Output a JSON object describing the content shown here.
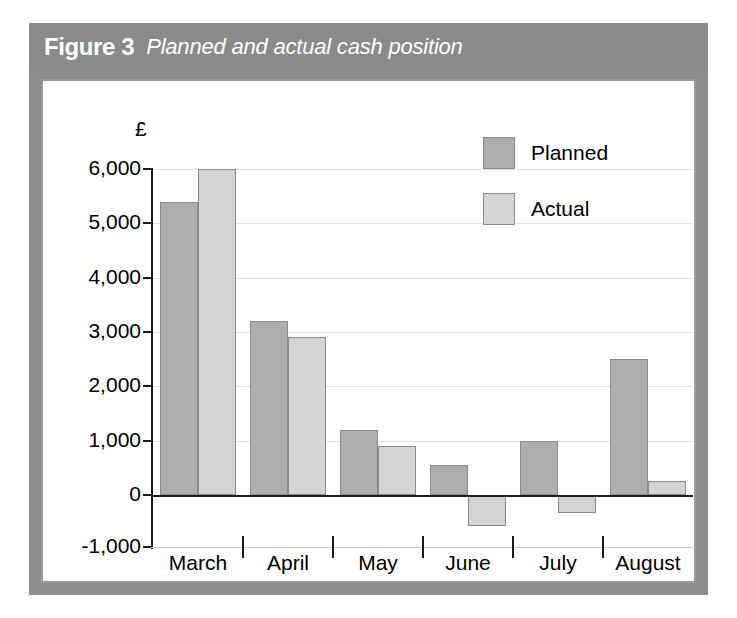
{
  "figure": {
    "number_label": "Figure 3",
    "caption": "Planned and actual cash position"
  },
  "legend": {
    "position": "top-right",
    "items": [
      {
        "label": "Planned",
        "swatch": "planned-swatch",
        "color": "#aeaeae"
      },
      {
        "label": "Actual",
        "swatch": "actual-swatch",
        "color": "#d4d4d4"
      }
    ]
  },
  "axis": {
    "y_unit_symbol": "£",
    "y_ticks": [
      "6,000",
      "5,000",
      "4,000",
      "3,000",
      "2,000",
      "1,000",
      "0",
      "-1,000"
    ],
    "x_ticks": [
      "March",
      "April",
      "May",
      "June",
      "July",
      "August"
    ]
  },
  "colors": {
    "frame": "#8e8e8e",
    "title_band": "#8a8a8a",
    "title_text": "#ffffff",
    "panel": "#ffffff",
    "panel_border": "#9a9a9a",
    "planned_bar": "#aeaeae",
    "actual_bar": "#d4d4d4",
    "bar_outline": "#8a8a8a",
    "axis_line": "#1a1a1a",
    "gridline": "#e2e2e2"
  },
  "chart_data": {
    "type": "bar",
    "title": "Planned and actual cash position",
    "xlabel": "",
    "ylabel": "£",
    "categories": [
      "March",
      "April",
      "May",
      "June",
      "July",
      "August"
    ],
    "series": [
      {
        "name": "Planned",
        "color": "#aeaeae",
        "values": [
          5400,
          3200,
          1200,
          550,
          1000,
          2500
        ]
      },
      {
        "name": "Actual",
        "color": "#d4d4d4",
        "values": [
          6000,
          2900,
          900,
          -600,
          -350,
          250
        ]
      }
    ],
    "ylim": [
      -1000,
      6000
    ],
    "ytick_values": [
      6000,
      5000,
      4000,
      3000,
      2000,
      1000,
      0,
      -1000
    ],
    "ytick_labels": [
      "6,000",
      "5,000",
      "4,000",
      "3,000",
      "2,000",
      "1,000",
      "0",
      "-1,000"
    ],
    "grid": true,
    "legend_position": "top-right",
    "zero_line": true
  }
}
